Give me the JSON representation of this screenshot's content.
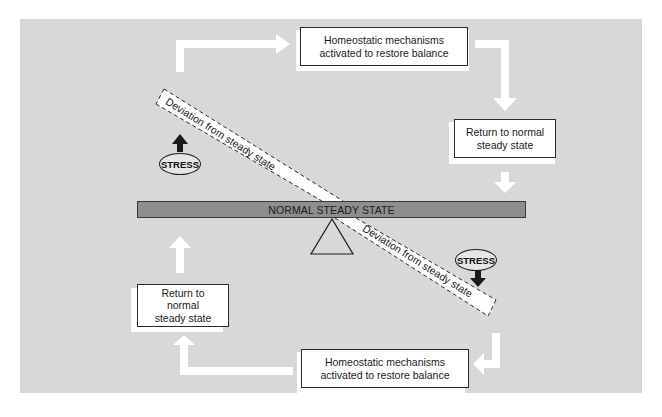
{
  "diagram": {
    "colors": {
      "background": "#ffffff",
      "panel": "#d8d8d8",
      "beam_fill": "#8e8e8e",
      "box_fill": "#ffffff",
      "arrow_fill": "#ffffff",
      "stress_arrow": "#1a1a1a"
    },
    "beam": {
      "label": "NORMAL STEADY STATE"
    },
    "fulcrum": {
      "shape": "triangle-outline"
    },
    "deviation_upper": {
      "label": "Deviation from steady state"
    },
    "deviation_lower": {
      "label": "Deviation from steady state"
    },
    "stress_upper": {
      "label": "STRESS",
      "arrow": "up-arrow-icon"
    },
    "stress_lower": {
      "label": "STRESS",
      "arrow": "down-arrow-icon"
    },
    "boxes": {
      "top_mechanisms": {
        "line1": "Homeostatic mechanisms",
        "line2": "activated to restore balance"
      },
      "right_return": {
        "line1": "Return to normal",
        "line2": "steady state"
      },
      "left_return": {
        "line1": "Return to",
        "line2": "normal",
        "line3": "steady state"
      },
      "bottom_mechanisms": {
        "line1": "Homeostatic mechanisms",
        "line2": "activated to restore balance"
      }
    },
    "flow_arrows": [
      {
        "name": "top-left-elbow-arrow",
        "direction": "up-then-right"
      },
      {
        "name": "top-right-elbow-arrow",
        "direction": "right-then-down"
      },
      {
        "name": "right-down-arrow",
        "direction": "down"
      },
      {
        "name": "bottom-right-elbow-arrow",
        "direction": "down-then-left"
      },
      {
        "name": "bottom-left-elbow-arrow",
        "direction": "left-then-up"
      },
      {
        "name": "left-up-arrow",
        "direction": "up"
      }
    ]
  }
}
